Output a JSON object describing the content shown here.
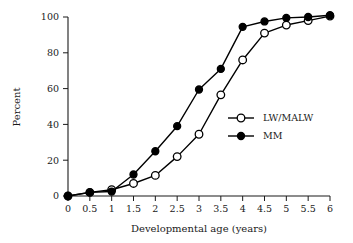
{
  "chart_data": {
    "type": "line",
    "title": "",
    "subtitle": "",
    "xlabel": "Developmental age (years)",
    "ylabel": "Percent",
    "xlim": [
      0,
      6
    ],
    "ylim": [
      0,
      100
    ],
    "grid": false,
    "legend_position": "center-right",
    "x": [
      0,
      0.5,
      1,
      1.5,
      2,
      2.5,
      3,
      3.5,
      4,
      4.5,
      5,
      5.5,
      6
    ],
    "xticks": [
      "0",
      "0.5",
      "1",
      "1.5",
      "2",
      "2.5",
      "3",
      "3.5",
      "4",
      "4.5",
      "5",
      "5.5",
      "6"
    ],
    "yticks": [
      "0",
      "20",
      "40",
      "60",
      "80",
      "100"
    ],
    "ytick_values": [
      0,
      20,
      40,
      60,
      80,
      100
    ],
    "series": [
      {
        "name": "LW/MALW",
        "marker": "open-circle",
        "color": "#000000",
        "values": [
          0,
          2,
          3.5,
          7,
          11.5,
          22,
          34.5,
          56.5,
          76,
          91,
          95.5,
          98,
          100.5
        ]
      },
      {
        "name": "MM",
        "marker": "filled-circle",
        "color": "#000000",
        "values": [
          0,
          2,
          2.5,
          12,
          25,
          39,
          59.5,
          71,
          94.5,
          97.5,
          99.5,
          100,
          101
        ]
      }
    ],
    "annotations": []
  },
  "legend": {
    "entries": [
      {
        "label": "LW/MALW",
        "marker": "open-circle"
      },
      {
        "label": "MM",
        "marker": "filled-circle"
      }
    ]
  }
}
